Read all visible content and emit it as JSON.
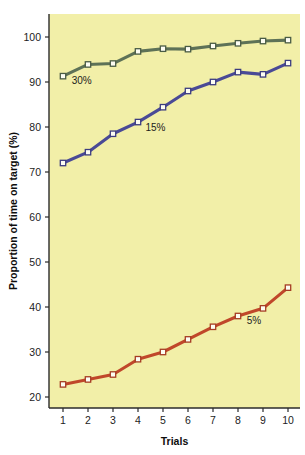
{
  "chart_data": {
    "type": "line",
    "title": "",
    "xlabel": "Trials",
    "ylabel": "Proportion of time on target (%)",
    "x": [
      1,
      2,
      3,
      4,
      5,
      6,
      7,
      8,
      9,
      10
    ],
    "xticklabels": [
      "1",
      "2",
      "3",
      "4",
      "5",
      "6",
      "7",
      "8",
      "9",
      "10"
    ],
    "yticklabels": [
      "20",
      "30",
      "40",
      "50",
      "60",
      "70",
      "80",
      "90",
      "100"
    ],
    "yticks": [
      20,
      30,
      40,
      50,
      60,
      70,
      80,
      90,
      100
    ],
    "xlim": [
      0.5,
      10.5
    ],
    "ylim": [
      16,
      104
    ],
    "grid": false,
    "legend": "inline-annotations",
    "plot_background": "#f2efa8",
    "figure_background": "#ffffff",
    "series": [
      {
        "name": "30%",
        "label": "30%",
        "color": "#5e7257",
        "marker": "square",
        "marker_edge": "#4a5c45",
        "marker_face": "#fdfdf3",
        "annotation": "30%",
        "annotation_x": 1.35,
        "annotation_y": 89.6,
        "values": [
          91.3,
          93.9,
          94.1,
          96.8,
          97.4,
          97.3,
          98.0,
          98.6,
          99.1,
          99.3
        ]
      },
      {
        "name": "15%",
        "label": "15%",
        "color": "#4a4a96",
        "marker": "square",
        "marker_edge": "#3c3c80",
        "marker_face": "#fdfdf3",
        "annotation": "15%",
        "annotation_x": 4.3,
        "annotation_y": 79.2,
        "values": [
          72.0,
          74.4,
          78.5,
          81.1,
          84.4,
          88.0,
          90.0,
          92.2,
          91.7,
          94.2
        ]
      },
      {
        "name": "5%",
        "label": "5%",
        "color": "#c0472a",
        "marker": "square",
        "marker_edge": "#a63d24",
        "marker_face": "#fdfdf3",
        "annotation": "5%",
        "annotation_x": 8.35,
        "annotation_y": 36.3,
        "values": [
          22.8,
          23.9,
          25.0,
          28.4,
          30.0,
          32.8,
          35.6,
          38.0,
          39.7,
          44.3
        ]
      }
    ]
  },
  "axes": {
    "x_title": "Trials",
    "y_title": "Proportion of time on target (%)"
  }
}
